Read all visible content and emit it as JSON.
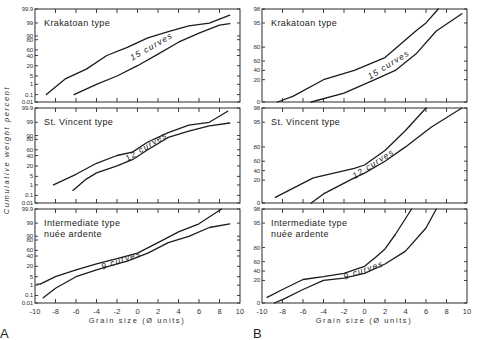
{
  "figure": {
    "y_axis_title": "Cumulative weight percent",
    "x_axis_title": "Grain size (Ø units)",
    "panel_letters": [
      "A",
      "B"
    ]
  },
  "chart_data": [
    {
      "type": "line",
      "column": "A",
      "title": "Krakatoan type",
      "curve_label": "15 curves",
      "xlabel": "Grain size (Ø units)",
      "ylabel": "Cumulative weight percent",
      "xlim": [
        -10,
        10
      ],
      "x_ticks": [
        -10,
        -8,
        -6,
        -4,
        -2,
        0,
        2,
        4,
        6,
        8,
        10
      ],
      "y_scale": "probability",
      "y_ticks": [
        "99.9",
        "99",
        "90",
        "80",
        "60",
        "40",
        "20",
        "5",
        "1",
        "0.1",
        "0.01"
      ],
      "series": [
        {
          "name": "upper envelope",
          "x": [
            -8.9,
            -7,
            -5,
            -3,
            -1,
            1,
            3,
            5,
            7,
            9
          ],
          "y": [
            0.1,
            3,
            15,
            40,
            65,
            85,
            93,
            97,
            98.8,
            99.5
          ]
        },
        {
          "name": "lower envelope",
          "x": [
            -6.2,
            -4,
            -2,
            0,
            2,
            4,
            6,
            8,
            9
          ],
          "y": [
            0.1,
            1,
            5,
            20,
            45,
            75,
            92,
            97.5,
            98.5
          ]
        }
      ]
    },
    {
      "type": "line",
      "column": "A",
      "title": "St. Vincent type",
      "curve_label": "12 curves",
      "xlim": [
        -10,
        10
      ],
      "y_scale": "probability",
      "y_ticks": [
        "99.9",
        "99",
        "90",
        "80",
        "60",
        "40",
        "20",
        "5",
        "1",
        "0.1",
        "0.01"
      ],
      "series": [
        {
          "name": "upper envelope",
          "x": [
            -8.2,
            -6,
            -4,
            -2,
            -0.5,
            1,
            3,
            5,
            7,
            8.8
          ],
          "y": [
            1,
            8,
            25,
            40,
            52,
            75,
            92,
            97,
            99,
            99.7
          ]
        },
        {
          "name": "lower envelope",
          "x": [
            -6.3,
            -5,
            -4,
            -2,
            -0.5,
            1,
            3,
            5,
            7,
            9
          ],
          "y": [
            0.3,
            3,
            10,
            20,
            32,
            60,
            85,
            93,
            96.5,
            98.5
          ]
        }
      ]
    },
    {
      "type": "line",
      "column": "A",
      "title": "Intermediate type nuée ardente",
      "title_lines": [
        "Intermediate type",
        "nuée ardente"
      ],
      "curve_label": "9 curves",
      "xlim": [
        -10,
        10
      ],
      "y_scale": "probability",
      "y_ticks": [
        "99.9",
        "99",
        "90",
        "80",
        "60",
        "40",
        "20",
        "5",
        "1",
        "0.1",
        "0.01"
      ],
      "series": [
        {
          "name": "upper envelope",
          "x": [
            -9.8,
            -9.5,
            -8,
            -6,
            -4,
            -2,
            0,
            2,
            4,
            6,
            8.2
          ],
          "y": [
            1.2,
            1.2,
            5,
            15,
            25,
            35,
            50,
            75,
            93,
            98.5,
            99.9
          ]
        },
        {
          "name": "lower envelope",
          "x": [
            -9.2,
            -8,
            -6,
            -4,
            -2,
            -1,
            1,
            3,
            5,
            7,
            9
          ],
          "y": [
            0.05,
            0.5,
            5,
            15,
            25,
            30,
            50,
            75,
            90,
            96,
            98.5
          ]
        }
      ]
    },
    {
      "type": "line",
      "column": "B",
      "title": "Krakatoan type",
      "curve_label": "15 curves",
      "xlim": [
        -10,
        10
      ],
      "x_ticks": [
        -10,
        -8,
        -6,
        -4,
        -2,
        0,
        2,
        4,
        6,
        8,
        10
      ],
      "y_scale": "linear-stretched",
      "y_ticks": [
        "98",
        "95",
        "80",
        "60",
        "40",
        "20",
        "0"
      ],
      "series": [
        {
          "name": "upper envelope",
          "x": [
            -8.5,
            -7,
            -4,
            -1,
            2,
            5,
            6,
            7.2
          ],
          "y": [
            0,
            5,
            20,
            40,
            65,
            90,
            95,
            98
          ]
        },
        {
          "name": "lower envelope",
          "x": [
            -5.2,
            -2,
            1,
            3,
            5,
            7,
            9.5
          ],
          "y": [
            0,
            8,
            20,
            40,
            70,
            90,
            97
          ]
        }
      ]
    },
    {
      "type": "line",
      "column": "B",
      "title": "St. Vincent type",
      "curve_label": "12 curves",
      "xlim": [
        -10,
        10
      ],
      "y_scale": "linear-stretched",
      "y_ticks": [
        "98",
        "95",
        "80",
        "60",
        "40",
        "20",
        "0"
      ],
      "series": [
        {
          "name": "upper envelope",
          "x": [
            -8.7,
            -5,
            -1,
            0,
            2,
            4,
            6
          ],
          "y": [
            5,
            25,
            45,
            52,
            75,
            90,
            98
          ]
        },
        {
          "name": "lower envelope",
          "x": [
            -5.2,
            -4,
            -1,
            0,
            2,
            4,
            6.5,
            9.5
          ],
          "y": [
            0,
            8,
            25,
            35,
            60,
            80,
            92,
            98
          ]
        }
      ]
    },
    {
      "type": "line",
      "column": "B",
      "title": "Intermediate type nuée ardente",
      "title_lines": [
        "Intermediate type",
        "nuée ardente"
      ],
      "curve_label": "9 curves",
      "xlim": [
        -10,
        10
      ],
      "y_scale": "linear-stretched",
      "y_ticks": [
        "98",
        "95",
        "80",
        "60",
        "40",
        "20",
        "0"
      ],
      "series": [
        {
          "name": "upper envelope",
          "x": [
            -9.5,
            -8,
            -6,
            -4,
            -2,
            0,
            1,
            2,
            3,
            4.6
          ],
          "y": [
            5,
            12,
            22,
            28,
            35,
            50,
            65,
            78,
            88,
            98
          ]
        },
        {
          "name": "lower envelope",
          "x": [
            -8.8,
            -8,
            -6,
            -4,
            -2,
            0,
            2,
            4,
            6,
            7
          ],
          "y": [
            0,
            3,
            12,
            20,
            25,
            35,
            55,
            75,
            92,
            98
          ]
        }
      ]
    }
  ]
}
